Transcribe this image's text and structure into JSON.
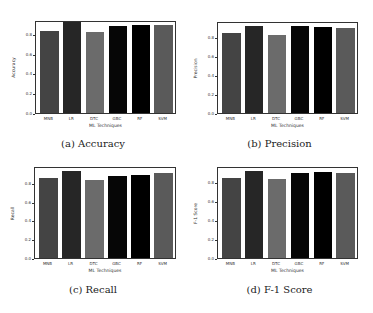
{
  "chart_data": [
    {
      "type": "bar",
      "title": "(a) Accuracy",
      "xlabel": "ML Techniques",
      "ylabel": "Accuracy",
      "categories": [
        "MNB",
        "LR",
        "DTC",
        "GBC",
        "RF",
        "SVM"
      ],
      "values": [
        0.83,
        0.92,
        0.82,
        0.88,
        0.89,
        0.885
      ],
      "yticks": [
        "0.0",
        "0.2",
        "0.4",
        "0.6",
        "0.8"
      ],
      "ylim": [
        0,
        0.93
      ],
      "grid": false
    },
    {
      "type": "bar",
      "title": "(b) Precision",
      "xlabel": "ML Techniques",
      "ylabel": "Precision",
      "categories": [
        "MNB",
        "LR",
        "DTC",
        "GBC",
        "RF",
        "SVM"
      ],
      "values": [
        0.84,
        0.92,
        0.82,
        0.92,
        0.91,
        0.9
      ],
      "yticks": [
        "0.0",
        "0.2",
        "0.4",
        "0.6",
        "0.8"
      ],
      "ylim": [
        0,
        0.96
      ],
      "grid": false
    },
    {
      "type": "bar",
      "title": "(c) Recall",
      "xlabel": "ML Techniques",
      "ylabel": "Recall",
      "categories": [
        "MNB",
        "LR",
        "DTC",
        "GBC",
        "RF",
        "SVM"
      ],
      "values": [
        0.85,
        0.93,
        0.83,
        0.87,
        0.89,
        0.91
      ],
      "yticks": [
        "0.0",
        "0.2",
        "0.4",
        "0.6",
        "0.8"
      ],
      "ylim": [
        0,
        0.97
      ],
      "grid": false
    },
    {
      "type": "bar",
      "title": "(d) F-1 Score",
      "xlabel": "ML Techniques",
      "ylabel": "F-1 Score",
      "categories": [
        "MNB",
        "LR",
        "DTC",
        "GBC",
        "RF",
        "SVM"
      ],
      "values": [
        0.84,
        0.92,
        0.83,
        0.9,
        0.91,
        0.9
      ],
      "yticks": [
        "0.0",
        "0.2",
        "0.4",
        "0.6",
        "0.8"
      ],
      "ylim": [
        0,
        0.96
      ],
      "grid": false
    }
  ],
  "bar_colors": [
    "#444444",
    "#262626",
    "#6b6b6b",
    "#060606",
    "#000000",
    "#5a5a5a"
  ],
  "captions": {
    "a": "(a) Accuracy",
    "b": "(b) Precision",
    "c": "(c) Recall",
    "d": "(d) F-1 Score"
  }
}
